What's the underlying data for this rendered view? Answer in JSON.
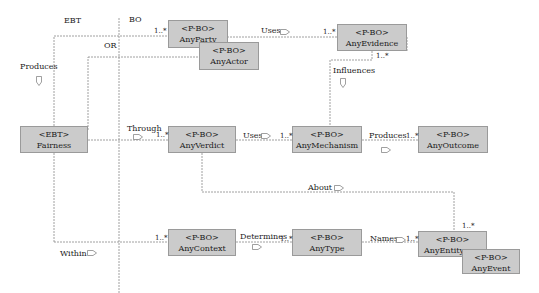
{
  "diagram": {
    "regions": {
      "left": "EBT",
      "right": "BO"
    },
    "boxes": {
      "anyparty": {
        "stereotype": "<P-BO>",
        "name": "AnyParty"
      },
      "anyactor": {
        "stereotype": "<P-BO>",
        "name": "AnyActor"
      },
      "anyevidence": {
        "stereotype": "<P-BO>",
        "name": "AnyEvidence"
      },
      "fairness": {
        "stereotype": "<EBT>",
        "name": "Fairness"
      },
      "anyverdict": {
        "stereotype": "<P-BO>",
        "name": "AnyVerdict"
      },
      "anymechanism": {
        "stereotype": "<P-BO>",
        "name": "AnyMechanism"
      },
      "anyoutcome": {
        "stereotype": "<P-BO>",
        "name": "AnyOutcome"
      },
      "anycontext": {
        "stereotype": "<P-BO>",
        "name": "AnyContext"
      },
      "anytype": {
        "stereotype": "<P-BO>",
        "name": "AnyType"
      },
      "anyentity": {
        "stereotype": "<P-BO>",
        "name": "AnyEntity"
      },
      "anyevent": {
        "stereotype": "<P-BO>",
        "name": "AnyEvent"
      }
    },
    "associations": {
      "produces_left": "Produces",
      "or": "OR",
      "uses_top": "Uses",
      "influences": "Influences",
      "through": "Through",
      "uses_mid": "Uses",
      "produces_mid": "Produces",
      "about": "About",
      "within": "Within",
      "determines": "Determines",
      "names": "Names"
    },
    "multiplicity": "1..*"
  }
}
